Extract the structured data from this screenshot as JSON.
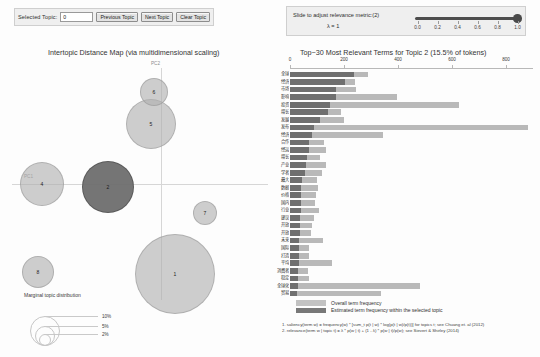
{
  "controls": {
    "selected_topic_label": "Selected Topic:",
    "selected_topic_value": "0",
    "previous_topic": "Previous Topic",
    "next_topic": "Next Topic",
    "clear_topic": "Clear Topic",
    "lambda_instruction": "Slide to adjust relevance metric:(2)",
    "lambda_value": "λ = 1",
    "slider_ticks": [
      "0.0",
      "0.2",
      "0.4",
      "0.6",
      "0.8",
      "1.0"
    ],
    "slider_position_pct": 100
  },
  "left_panel": {
    "title": "Intertopic Distance Map (via multidimensional scaling)",
    "axis_x_label": "PC1",
    "axis_y_label": "PC2",
    "topics": [
      {
        "id": "1",
        "cx": 163,
        "cy": 214,
        "r": 40,
        "selected": false
      },
      {
        "id": "2",
        "cx": 96,
        "cy": 127,
        "r": 26,
        "selected": true
      },
      {
        "id": "4",
        "cx": 30,
        "cy": 124,
        "r": 22,
        "selected": false
      },
      {
        "id": "5",
        "cx": 139,
        "cy": 64,
        "r": 25,
        "selected": false
      },
      {
        "id": "6",
        "cx": 142,
        "cy": 32,
        "r": 14,
        "selected": false
      },
      {
        "id": "7",
        "cx": 193,
        "cy": 153,
        "r": 12,
        "selected": false
      },
      {
        "id": "8",
        "cx": 26,
        "cy": 212,
        "r": 16,
        "selected": false
      }
    ],
    "marginal_legend": {
      "title": "Marginal topic distribution",
      "items": [
        {
          "label": "2%",
          "r": 5
        },
        {
          "label": "5%",
          "r": 9
        },
        {
          "label": "10%",
          "r": 14
        }
      ]
    }
  },
  "right_panel": {
    "title": "Top−30 Most Relevant Terms for Topic 2 (15.5% of tokens)",
    "legend": [
      {
        "swatch": "all",
        "label": "Overall term frequency"
      },
      {
        "swatch": "sel",
        "label": "Estimated term frequency within the selected topic"
      }
    ],
    "footnotes": [
      "1. saliency(term w) = frequency(w) * [sum_t p(t | w) * log(p(t | w)/p(t))] for topics t; see Chuang et. al (2012)",
      "2. relevance(term w | topic t) = λ * p(w | t) + (1 - λ) * p(w | t)/p(w); see Sievert & Shirley (2014)"
    ]
  },
  "chart_data": {
    "type": "bar",
    "title": "Top−30 Most Relevant Terms for Topic 2 (15.5% of tokens)",
    "xlabel": "",
    "ylabel": "",
    "xlim": [
      0,
      900
    ],
    "xticks": [
      0,
      200,
      400,
      600,
      800
    ],
    "grid": false,
    "legend_position": "bottom",
    "orientation": "horizontal",
    "categories": [
      "全球",
      "经济",
      "市场",
      "影响",
      "投资",
      "增长",
      "发展",
      "发布",
      "经济",
      "合作",
      "经运",
      "增长",
      "产业",
      "学者",
      "最大",
      "数据",
      "价格",
      "国内",
      "行业",
      "建议",
      "开放",
      "开放",
      "未来",
      "国际",
      "打造",
      "平均",
      "消费者",
      "稳定",
      "全球化",
      "贸易"
    ],
    "series": [
      {
        "name": "Overall term frequency",
        "values": [
          290,
          240,
          245,
          395,
          625,
          190,
          200,
          880,
          345,
          125,
          135,
          112,
          135,
          120,
          100,
          105,
          95,
          92,
          108,
          88,
          80,
          78,
          122,
          72,
          70,
          155,
          66,
          72,
          480,
          338
        ]
      },
      {
        "name": "Estimated term frequency within the selected topic",
        "values": [
          238,
          205,
          172,
          172,
          148,
          140,
          110,
          88,
          80,
          72,
          70,
          62,
          58,
          55,
          45,
          42,
          40,
          40,
          40,
          38,
          36,
          36,
          34,
          32,
          32,
          32,
          30,
          28,
          28,
          26
        ]
      }
    ]
  }
}
